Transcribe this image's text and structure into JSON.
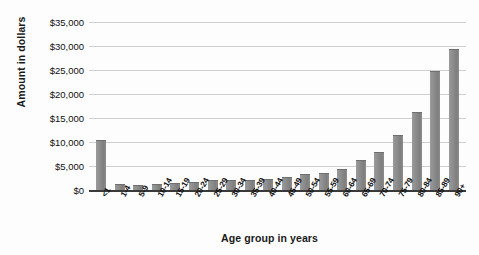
{
  "chart_data": {
    "type": "bar",
    "title": "",
    "xlabel": "Age group in years",
    "ylabel": "Amount in dollars",
    "ylim": [
      0,
      35000
    ],
    "ytick_labels": [
      "$35,000",
      "$30,000",
      "$25,000",
      "$20,000",
      "$15,000",
      "$10,000",
      "$5,000",
      "$0"
    ],
    "ytick_values": [
      35000,
      30000,
      25000,
      20000,
      15000,
      10000,
      5000,
      0
    ],
    "grid": true,
    "legend": "none",
    "categories": [
      "<1",
      "1-4",
      "5-9",
      "10-14",
      "15-19",
      "20-24",
      "25-29",
      "30-34",
      "35-39",
      "40-44",
      "45-49",
      "50-54",
      "55-59",
      "60-64",
      "65-69",
      "70-74",
      "75-79",
      "80-84",
      "85-89",
      "90+"
    ],
    "values": [
      10500,
      1300,
      1000,
      1200,
      1400,
      1600,
      2000,
      2100,
      2100,
      2200,
      2700,
      3300,
      3600,
      4300,
      6200,
      7900,
      11500,
      16300,
      24800,
      29400
    ],
    "bar_color": "#8b8b8b",
    "gridline_color": "#cfcfcf",
    "axis_color": "#3a3a3a"
  }
}
